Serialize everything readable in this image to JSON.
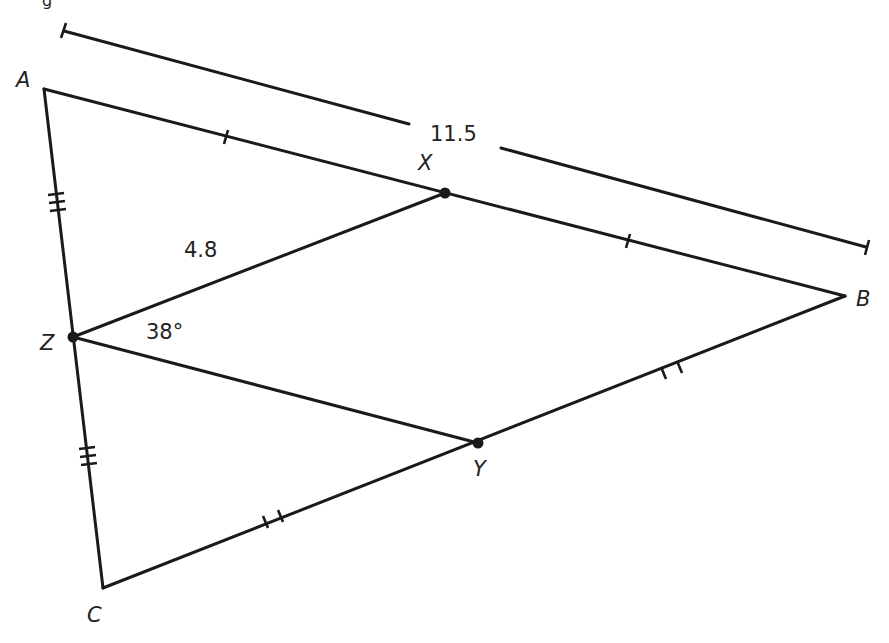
{
  "figure": {
    "vertices": [
      {
        "id": "A",
        "label": "A"
      },
      {
        "id": "B",
        "label": "B"
      },
      {
        "id": "C",
        "label": "C"
      },
      {
        "id": "X",
        "label": "X"
      },
      {
        "id": "Y",
        "label": "Y"
      },
      {
        "id": "Z",
        "label": "Z"
      }
    ],
    "measurements": {
      "AB_length": "11.5",
      "ZX_length": "4.8",
      "angle_XZY": "38°"
    },
    "congruence_marks": {
      "AX_XB": "single tick",
      "BY_YC": "double tick",
      "AZ_ZC": "triple tick"
    },
    "header_fragment": "g"
  }
}
